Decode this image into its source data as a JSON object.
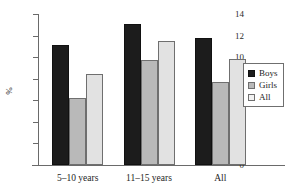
{
  "chart_data": {
    "type": "bar",
    "title": "",
    "subtitle": "",
    "xlabel": "",
    "ylabel": "%",
    "categories": [
      "5–10 years",
      "11–15 years",
      "All"
    ],
    "series": [
      {
        "name": "Boys",
        "color": "#1c1c1c",
        "values": [
          11.1,
          13.1,
          11.8
        ]
      },
      {
        "name": "Girls",
        "color": "#b9b9b9",
        "values": [
          6.2,
          9.7,
          7.7
        ]
      },
      {
        "name": "All",
        "color": "#e2e2e2",
        "values": [
          8.4,
          11.5,
          9.8
        ]
      }
    ],
    "ylim": [
      0,
      14
    ],
    "yticks": [
      0,
      2,
      4,
      6,
      8,
      10,
      12,
      14
    ],
    "ytick_labels": [
      "0",
      "2",
      "4",
      "6",
      "8",
      "10",
      "12",
      "14"
    ],
    "grid": false,
    "legend_position": "right-middle"
  },
  "axis": {
    "y_label": "%",
    "tick_0": "0",
    "tick_2": "2",
    "tick_4": "4",
    "tick_6": "6",
    "tick_8": "8",
    "tick_10": "10",
    "tick_12": "12",
    "tick_14": "14"
  },
  "groups": {
    "g0_label": "5–10 years",
    "g1_label": "11–15 years",
    "g2_label": "All"
  },
  "legend": {
    "boys_label": "Boys",
    "girls_label": "Girls",
    "all_label": "All"
  },
  "colors": {
    "boys": "#1c1c1c",
    "girls": "#b9b9b9",
    "all": "#e2e2e2",
    "axis": "#6a6a6a",
    "text": "#1e1e1e",
    "background": "#ffffff"
  }
}
